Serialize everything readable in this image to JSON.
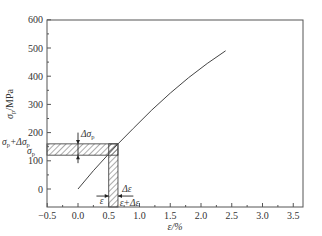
{
  "chart_data": {
    "type": "line",
    "title": "",
    "xlabel": "ε/%",
    "ylabel": "σp/MPa",
    "xlim": [
      -0.5,
      3.75
    ],
    "ylim": [
      -60,
      600
    ],
    "x_ticks": [
      -0.5,
      0.0,
      0.5,
      1.0,
      1.5,
      2.0,
      2.5,
      3.0,
      3.5
    ],
    "x_tick_labels": [
      "−0.5",
      "0.0",
      "0.5",
      "1.0",
      "1.5",
      "2.0",
      "2.5",
      "3.0",
      "3.5"
    ],
    "y_ticks": [
      0,
      100,
      200,
      300,
      400,
      500,
      600
    ],
    "y_tick_labels": [
      "0",
      "100",
      "200",
      "300",
      "400",
      "500",
      "600"
    ],
    "grid": false,
    "legend": null,
    "series": [
      {
        "name": "stress-strain curve",
        "x": [
          0.0,
          0.25,
          0.5,
          0.65,
          0.9,
          1.2,
          1.5,
          1.8,
          2.1,
          2.4
        ],
        "y": [
          0,
          65,
          125,
          160,
          215,
          280,
          340,
          395,
          445,
          490
        ]
      }
    ],
    "annotations": {
      "stress_band": {
        "label_low": "σp",
        "label_high": "σp+Δσp",
        "y_low": 120,
        "y_high": 160,
        "x_from": -0.5,
        "x_to": 0.65,
        "delta_label": "Δσp"
      },
      "strain_band": {
        "label_low": "ε",
        "label_high": "ε+Δε",
        "x_low": 0.5,
        "x_high": 0.65,
        "delta_label": "Δε"
      }
    }
  },
  "labels": {
    "xlabel": "ε/%",
    "ylabel_main": "σ",
    "ylabel_sub": "p",
    "ylabel_unit": "/MPa",
    "sigma_p": "σ",
    "sigma_p_sub": "p",
    "sigma_p_plus": "+Δσ",
    "delta_sigma": "Δσ",
    "delta_sigma_sub": "p",
    "eps": "ε",
    "eps_plus": "ε+Δε",
    "delta_eps": "Δε"
  }
}
